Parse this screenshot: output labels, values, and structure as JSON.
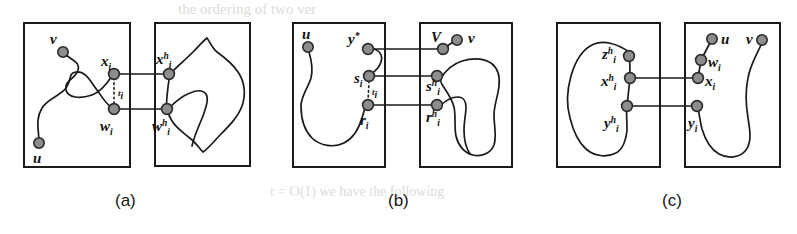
{
  "figure": {
    "background": "#ffffff",
    "ink": "#1a1a1a",
    "node_fill": "#8d8d8d",
    "node_stroke": "#2a2a2a",
    "box_stroke": "#1a1a1a",
    "bleed_color": "#d8d6d2"
  },
  "captions": [
    {
      "key": "a",
      "text": "(a)",
      "x": 125,
      "y": 205
    },
    {
      "key": "b",
      "text": "(b)",
      "x": 398,
      "y": 205
    },
    {
      "key": "c",
      "text": "(c)",
      "x": 672,
      "y": 205
    }
  ],
  "bleed_text": [
    {
      "text": "the ordering of  two ver",
      "x": 178,
      "y": 14,
      "size": 15
    },
    {
      "text": "t   in   Fi",
      "x": 22,
      "y": 78,
      "size": 15
    },
    {
      "text": "G    G   C",
      "x": 300,
      "y": 70,
      "size": 15
    },
    {
      "text": "the  C",
      "x": 175,
      "y": 118,
      "size": 15
    },
    {
      "text": "r  =  O(1)   we  have  the  following",
      "x": 270,
      "y": 196,
      "size": 14
    }
  ],
  "panels": [
    {
      "key": "a",
      "caption": "(a)",
      "boxes": [
        {
          "name": "panel-a-left-box",
          "x": 24,
          "y": 23,
          "w": 106,
          "h": 144
        },
        {
          "name": "panel-a-right-box",
          "x": 155,
          "y": 23,
          "w": 95,
          "h": 143
        }
      ],
      "nodes": [
        {
          "id": "v",
          "label": "v",
          "sup": "",
          "sub": "",
          "cx": 63,
          "cy": 52,
          "lx": 52,
          "ly": 44
        },
        {
          "id": "x_i",
          "label": "x",
          "sup": "",
          "sub": "i",
          "cx": 114,
          "cy": 74,
          "lx": 105,
          "ly": 66
        },
        {
          "id": "w_i",
          "label": "w",
          "sup": "",
          "sub": "i",
          "cx": 114,
          "cy": 109,
          "lx": 103,
          "ly": 129
        },
        {
          "id": "u",
          "label": "u",
          "sup": "",
          "sub": "",
          "cx": 39,
          "cy": 143,
          "lx": 34,
          "ly": 162
        },
        {
          "id": "x_ih",
          "label": "x",
          "sup": "h",
          "sub": "i",
          "cx": 169,
          "cy": 74,
          "lx": 158,
          "ly": 64
        },
        {
          "id": "w_ih",
          "label": "w",
          "sup": "h",
          "sub": "i",
          "cx": 167,
          "cy": 109,
          "lx": 155,
          "ly": 129
        }
      ],
      "links": [
        {
          "from": "x_i",
          "to": "x_ih"
        },
        {
          "from": "w_i",
          "to": "w_ih"
        }
      ],
      "dotted": [
        {
          "name": "t-edge-a",
          "x1": 114,
          "y1": 74,
          "x2": 114,
          "y2": 109,
          "label": "t",
          "sub": "i",
          "lx": 118,
          "ly": 95
        }
      ]
    },
    {
      "key": "b",
      "caption": "(b)",
      "boxes": [
        {
          "name": "panel-b-left-box",
          "x": 293,
          "y": 23,
          "w": 92,
          "h": 144
        },
        {
          "name": "panel-b-right-box",
          "x": 420,
          "y": 23,
          "w": 92,
          "h": 144
        }
      ],
      "nodes": [
        {
          "id": "u",
          "label": "u",
          "sup": "",
          "sub": "",
          "cx": 308,
          "cy": 47,
          "lx": 303,
          "ly": 38
        },
        {
          "id": "ystar",
          "label": "y",
          "sup": "*",
          "sub": "",
          "cx": 368,
          "cy": 49,
          "lx": 351,
          "ly": 42
        },
        {
          "id": "s_i",
          "label": "s",
          "sup": "",
          "sub": "i",
          "cx": 369,
          "cy": 76,
          "lx": 356,
          "ly": 82
        },
        {
          "id": "r_i",
          "label": "r",
          "sup": "",
          "sub": "i",
          "cx": 368,
          "cy": 105,
          "lx": 363,
          "ly": 124
        },
        {
          "id": "Vcap",
          "label": "V",
          "sup": "",
          "sub": "",
          "cx": 443,
          "cy": 49,
          "lx": 433,
          "ly": 42
        },
        {
          "id": "v",
          "label": "v",
          "sup": "",
          "sub": "",
          "cx": 457,
          "cy": 40,
          "lx": 468,
          "ly": 41
        },
        {
          "id": "s_ih",
          "label": "s",
          "sup": "h",
          "sub": "i",
          "cx": 437,
          "cy": 76,
          "lx": 428,
          "ly": 90
        },
        {
          "id": "r_ih",
          "label": "r",
          "sup": "h",
          "sub": "i",
          "cx": 437,
          "cy": 105,
          "lx": 428,
          "ly": 122
        }
      ],
      "links": [
        {
          "from": "ystar",
          "to": "Vcap"
        },
        {
          "from": "s_i",
          "to": "s_ih"
        },
        {
          "from": "r_i",
          "to": "r_ih"
        },
        {
          "from": "Vcap",
          "to": "v"
        }
      ],
      "dotted": [
        {
          "name": "t-edge-b",
          "x1": 369,
          "y1": 76,
          "x2": 368,
          "y2": 105,
          "label": "t",
          "sub": "i",
          "lx": 372,
          "ly": 94
        }
      ]
    },
    {
      "key": "c",
      "caption": "(c)",
      "boxes": [
        {
          "name": "panel-c-left-box",
          "x": 557,
          "y": 23,
          "w": 103,
          "h": 144
        },
        {
          "name": "panel-c-right-box",
          "x": 685,
          "y": 23,
          "w": 95,
          "h": 144
        }
      ],
      "nodes": [
        {
          "id": "z_ih",
          "label": "z",
          "sup": "h",
          "sub": "i",
          "cx": 629,
          "cy": 56,
          "lx": 605,
          "ly": 58
        },
        {
          "id": "x_ih",
          "label": "x",
          "sup": "h",
          "sub": "i",
          "cx": 630,
          "cy": 78,
          "lx": 604,
          "ly": 86
        },
        {
          "id": "y_ih",
          "label": "y",
          "sup": "h",
          "sub": "i",
          "cx": 627,
          "cy": 106,
          "lx": 607,
          "ly": 126
        },
        {
          "id": "u",
          "label": "u",
          "sup": "",
          "sub": "",
          "cx": 712,
          "cy": 39,
          "lx": 722,
          "ly": 43
        },
        {
          "id": "w_i",
          "label": "w",
          "sup": "",
          "sub": "i",
          "cx": 701,
          "cy": 60,
          "lx": 709,
          "ly": 66
        },
        {
          "id": "x_i",
          "label": "x",
          "sup": "",
          "sub": "i",
          "cx": 698,
          "cy": 78,
          "lx": 706,
          "ly": 86
        },
        {
          "id": "y_i",
          "label": "y",
          "sup": "",
          "sub": "i",
          "cx": 697,
          "cy": 106,
          "lx": 690,
          "ly": 126
        },
        {
          "id": "v",
          "label": "v",
          "sup": "",
          "sub": "",
          "cx": 762,
          "cy": 40,
          "lx": 748,
          "ly": 43
        }
      ],
      "links": [
        {
          "from": "x_ih",
          "to": "x_i"
        },
        {
          "from": "y_ih",
          "to": "y_i"
        },
        {
          "from": "u",
          "to": "w_i"
        },
        {
          "from": "w_i",
          "to": "x_i"
        }
      ],
      "dotted": []
    }
  ]
}
